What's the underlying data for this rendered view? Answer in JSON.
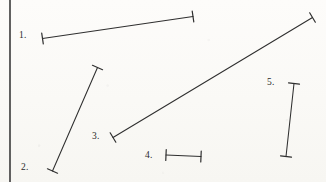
{
  "figure": {
    "kind": "line-segment-measurement-figure",
    "background_color": "#fbfaf7",
    "ink_color": "#2b2b2b",
    "rule_color": "#3a3a3a",
    "width": 326,
    "height": 182,
    "left_rule": {
      "x": 10,
      "y1": 0,
      "y2": 182,
      "thickness": 1.6
    },
    "segments": [
      {
        "label": "1.",
        "label_x": 19,
        "label_y": 31,
        "x1": 42.5,
        "y1": 38.5,
        "x2": 193.0,
        "y2": 16.5,
        "cap_length": 11,
        "orientation": "shallow-rising",
        "stroke": "#2f2f2f",
        "stroke_width": 1.05
      },
      {
        "label": "2.",
        "label_x": 21,
        "label_y": 163,
        "x1": 52.5,
        "y1": 171.0,
        "x2": 97.5,
        "y2": 67.5,
        "cap_length": 11,
        "orientation": "steep-rising",
        "stroke": "#2f2f2f",
        "stroke_width": 1.05
      },
      {
        "label": "3.",
        "label_x": 92,
        "label_y": 132,
        "x1": 113.0,
        "y1": 137.5,
        "x2": 312.5,
        "y2": 17.5,
        "cap_length": 11,
        "orientation": "diagonal-rising",
        "stroke": "#2f2f2f",
        "stroke_width": 1.05
      },
      {
        "label": "4.",
        "label_x": 145,
        "label_y": 151,
        "x1": 166.0,
        "y1": 155.0,
        "x2": 201.0,
        "y2": 156.5,
        "cap_length": 11,
        "orientation": "horizontal",
        "stroke": "#2f2f2f",
        "stroke_width": 1.05
      },
      {
        "label": "5.",
        "label_x": 267,
        "label_y": 78,
        "x1": 294.0,
        "y1": 83.5,
        "x2": 286.0,
        "y2": 156.5,
        "cap_length": 11,
        "orientation": "vertical",
        "stroke": "#2f2f2f",
        "stroke_width": 1.05
      }
    ]
  }
}
